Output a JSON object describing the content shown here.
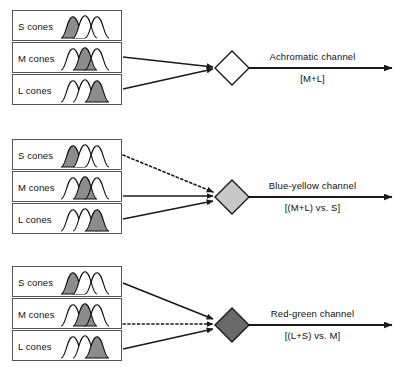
{
  "diagram": {
    "colors": {
      "line": "#1a1a1a",
      "box_border": "#555555",
      "curve_stroke": "#111111",
      "curve_fill": "#8c8c8c",
      "diamond_white": "#ffffff",
      "diamond_light": "#c8c8c8",
      "diamond_dark": "#696969",
      "text": "#111111",
      "background": "#ffffff"
    },
    "cone_labels": {
      "s": "S cones",
      "m": "M cones",
      "l": "L cones"
    },
    "rows": [
      {
        "id": "achromatic",
        "channel_name": "Achromatic channel",
        "channel_formula": "[M+L]",
        "diamond_fill": "white",
        "inputs": [
          {
            "cone": "S cones",
            "connected": false,
            "style": "none",
            "highlight_index": 0
          },
          {
            "cone": "M cones",
            "connected": true,
            "style": "solid",
            "highlight_index": 1
          },
          {
            "cone": "L cones",
            "connected": true,
            "style": "solid",
            "highlight_index": 2
          }
        ]
      },
      {
        "id": "blue-yellow",
        "channel_name": "Blue-yellow channel",
        "channel_formula": "[(M+L) vs. S]",
        "diamond_fill": "light-gray",
        "inputs": [
          {
            "cone": "S cones",
            "connected": true,
            "style": "dotted",
            "highlight_index": 0
          },
          {
            "cone": "M cones",
            "connected": true,
            "style": "solid",
            "highlight_index": 1
          },
          {
            "cone": "L cones",
            "connected": true,
            "style": "solid",
            "highlight_index": 2
          }
        ]
      },
      {
        "id": "red-green",
        "channel_name": "Red-green channel",
        "channel_formula": "[(L+S) vs. M]",
        "diamond_fill": "dark-gray",
        "inputs": [
          {
            "cone": "S cones",
            "connected": true,
            "style": "solid",
            "highlight_index": 0
          },
          {
            "cone": "M cones",
            "connected": true,
            "style": "dotted",
            "highlight_index": 1
          },
          {
            "cone": "L cones",
            "connected": true,
            "style": "solid",
            "highlight_index": 2
          }
        ]
      }
    ]
  }
}
